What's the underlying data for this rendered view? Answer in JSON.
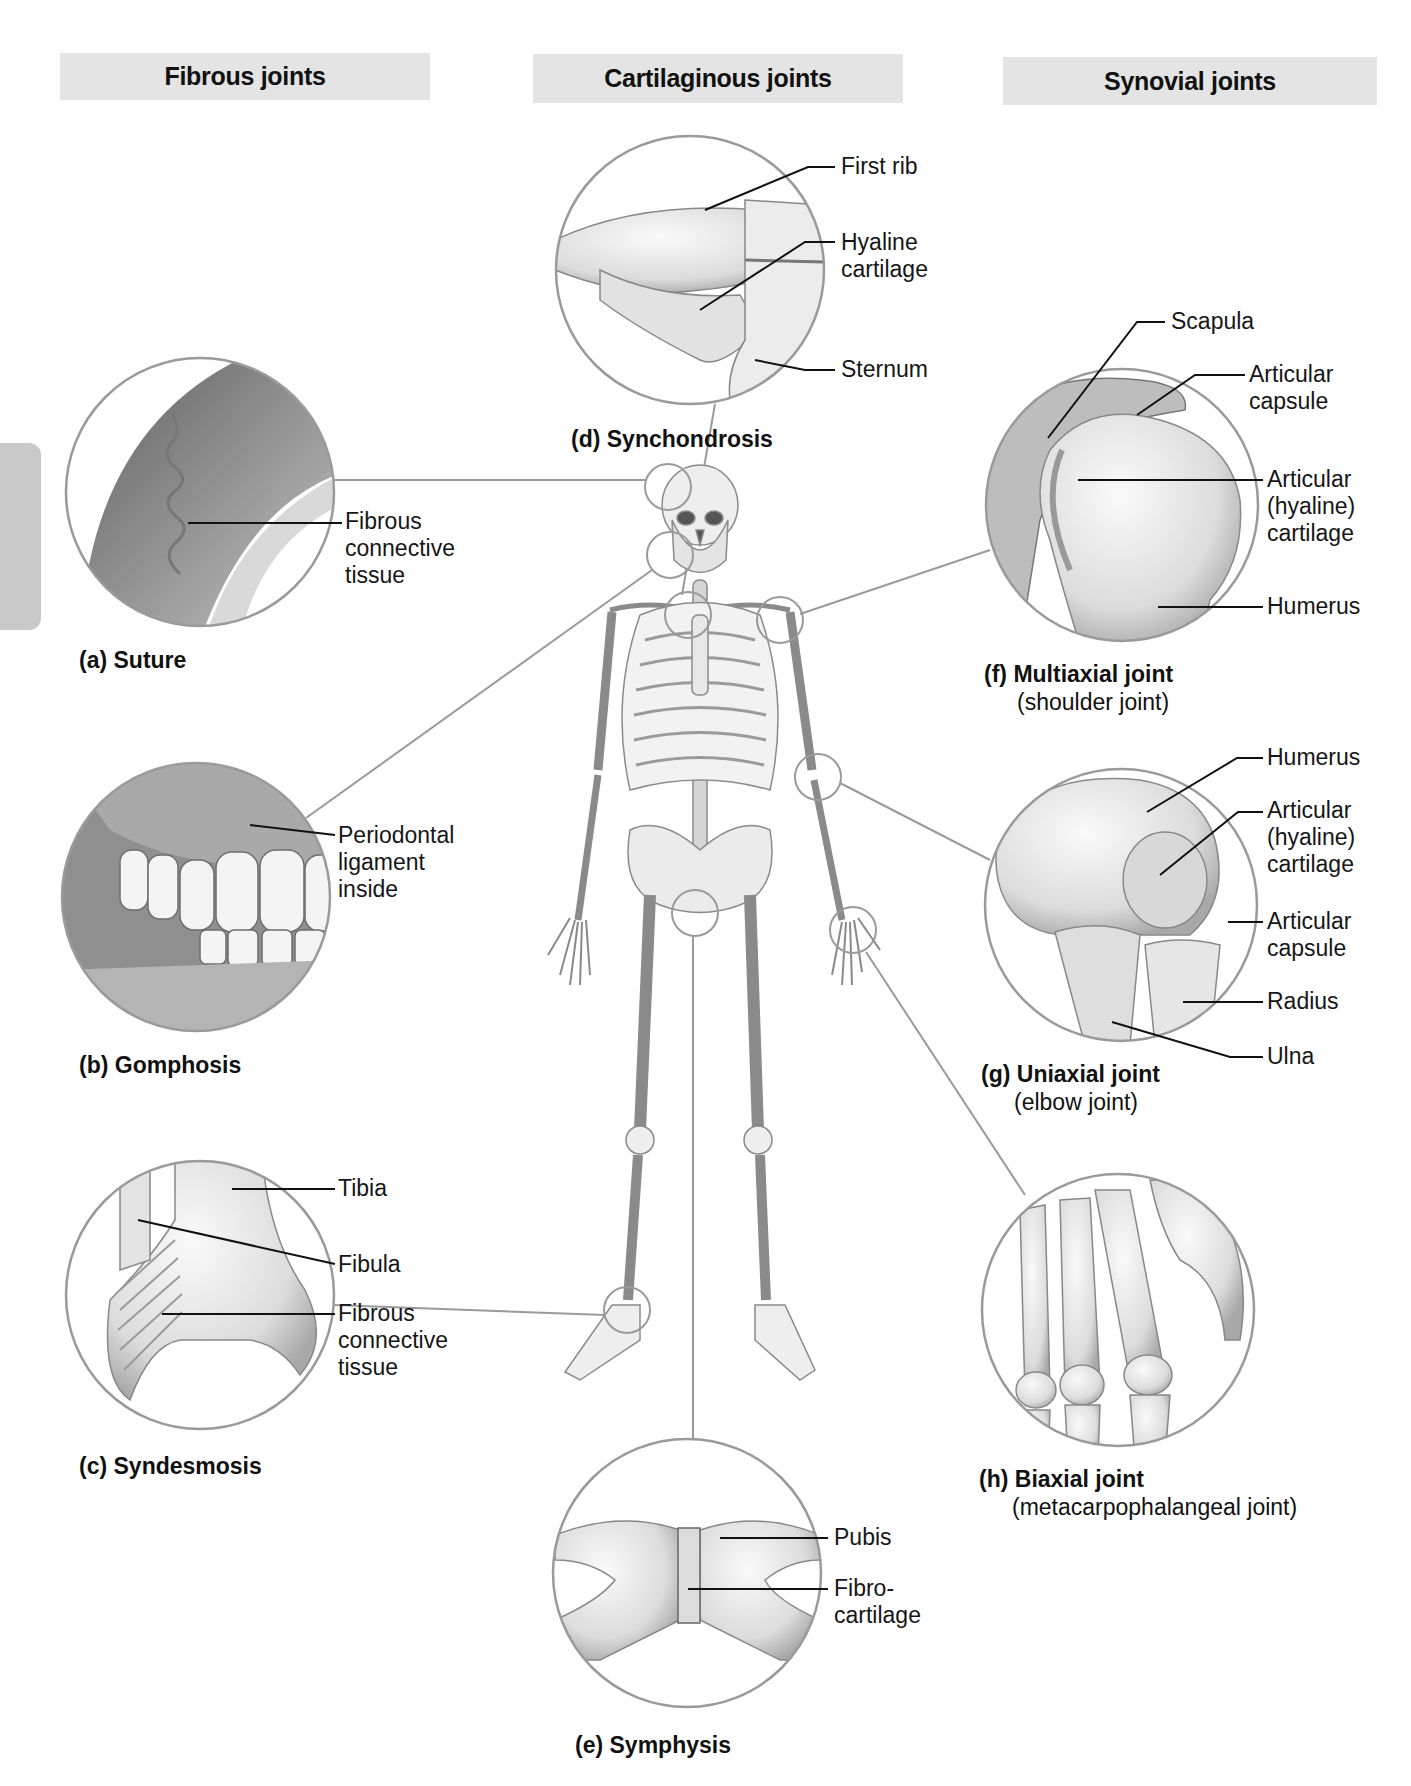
{
  "headers": {
    "fibrous": "Fibrous joints",
    "cartilaginous": "Cartilaginous joints",
    "synovial": "Synovial joints"
  },
  "panels": {
    "a": {
      "letter": "(a)",
      "title": "Suture",
      "labels": [
        "Fibrous",
        "connective",
        "tissue"
      ]
    },
    "b": {
      "letter": "(b)",
      "title": "Gomphosis",
      "labels": [
        "Periodontal",
        "ligament",
        "inside"
      ]
    },
    "c": {
      "letter": "(c)",
      "title": "Syndesmosis",
      "labels": {
        "tibia": "Tibia",
        "fibula": "Fibula",
        "fibrous": [
          "Fibrous",
          "connective",
          "tissue"
        ]
      }
    },
    "d": {
      "letter": "(d)",
      "title": "Synchondrosis",
      "labels": {
        "first_rib": "First rib",
        "hyaline": [
          "Hyaline",
          "cartilage"
        ],
        "sternum": "Sternum"
      }
    },
    "e": {
      "letter": "(e)",
      "title": "Symphysis",
      "labels": {
        "pubis": "Pubis",
        "fibro": [
          "Fibro-",
          "cartilage"
        ]
      }
    },
    "f": {
      "letter": "(f)",
      "title": "Multiaxial joint",
      "subtitle": "(shoulder joint)",
      "labels": {
        "scapula": "Scapula",
        "capsule": [
          "Articular",
          "capsule"
        ],
        "cartilage": [
          "Articular",
          "(hyaline)",
          "cartilage"
        ],
        "humerus": "Humerus"
      }
    },
    "g": {
      "letter": "(g)",
      "title": "Uniaxial joint",
      "subtitle": "(elbow joint)",
      "labels": {
        "humerus": "Humerus",
        "cartilage": [
          "Articular",
          "(hyaline)",
          "cartilage"
        ],
        "capsule": [
          "Articular",
          "capsule"
        ],
        "radius": "Radius",
        "ulna": "Ulna"
      }
    },
    "h": {
      "letter": "(h)",
      "title": "Biaxial joint",
      "subtitle": "(metacarpophalangeal joint)"
    }
  },
  "colors": {
    "header_bg": "#e4e4e4",
    "circle_stroke": "#9a9a9a",
    "leader_line": "#111111",
    "bone_fill": "#e9e9e9",
    "bone_shade": "#b8b8b8",
    "side_tab": "#c9c9c9"
  }
}
